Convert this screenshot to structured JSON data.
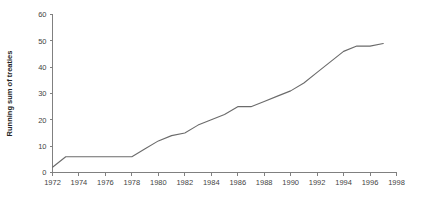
{
  "chart_data": {
    "type": "line",
    "title": "",
    "subtitle": "",
    "xlabel": "",
    "ylabel": "Running sum of treaties",
    "xlim": [
      1972,
      1998
    ],
    "ylim": [
      0,
      60
    ],
    "grid": false,
    "legend": null,
    "legend_position": "none",
    "line_color": "#6b6b6b",
    "axis_color": "#808080",
    "xticks": [
      1972,
      1974,
      1976,
      1978,
      1980,
      1982,
      1984,
      1986,
      1988,
      1990,
      1992,
      1994,
      1996,
      1998
    ],
    "xtick_labels": [
      "1972",
      "1974",
      "1976",
      "1978",
      "1980",
      "1982",
      "1984",
      "1986",
      "1988",
      "1990",
      "1992",
      "1994",
      "1996",
      "1998"
    ],
    "yticks": [
      0,
      10,
      20,
      30,
      40,
      50,
      60
    ],
    "ytick_labels": [
      "0",
      "10",
      "20",
      "30",
      "40",
      "50",
      "60"
    ],
    "series": [
      {
        "name": "Running sum of treaties",
        "x": [
          1972,
          1973,
          1978,
          1979,
          1980,
          1981,
          1982,
          1983,
          1984,
          1985,
          1986,
          1987,
          1988,
          1989,
          1990,
          1991,
          1992,
          1993,
          1994,
          1995,
          1996,
          1997
        ],
        "values": [
          2,
          6,
          6,
          9,
          12,
          14,
          15,
          18,
          20,
          22,
          25,
          25,
          27,
          29,
          31,
          34,
          38,
          42,
          46,
          48,
          48,
          49
        ]
      }
    ]
  }
}
